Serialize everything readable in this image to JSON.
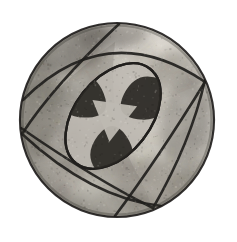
{
  "image": {
    "kind": "photograph",
    "subject": "carved stone sphere with inscribed geometric star pattern",
    "medium": "monochrome halftone photograph",
    "background_color": "#ffffff",
    "width": 237,
    "height": 242,
    "caption": "Spherical artifact incised with a three-fold curved-arc star motif",
    "alt_text": "Black and white photograph of a weathered round ball-shaped object. Three broad arcs sweep across its face dividing it into curved triangular panels, and a lens-shaped medallion at the centre holds a three-pointed dark star surrounding a pale triangle."
  },
  "sphere": {
    "label": "sphere-body",
    "center_x": 117,
    "center_y": 120,
    "radius": 97,
    "rim_color": "#1d1b19",
    "rim_width": 2.2,
    "base_light": "#cfcbc4",
    "base_mid": "#a8a49c",
    "base_dark": "#6e6a64",
    "highlight_x": 150,
    "highlight_y": 78
  },
  "palette": {
    "paper_white": "#ffffff",
    "rim_black": "#1d1b19",
    "ink_black": "#211f1d",
    "petal_dark": "#2b2925",
    "petal_shadow": "#3a3732",
    "panel_light": "#c6c2ba",
    "panel_mid": "#aba79f",
    "panel_shade": "#8d8981",
    "patina_dark": "#5d5952",
    "patina_darker": "#484440",
    "highlight": "#e3dfd7",
    "inner_triangle": "#bdb9b1"
  },
  "geometry": {
    "arcs": [
      {
        "name": "arc-upper-right",
        "note": "sweeps from upper-left of disc to lower-right rim"
      },
      {
        "name": "arc-lower-left",
        "note": "sweeps from left rim down across to bottom rim"
      },
      {
        "name": "arc-right",
        "note": "sweeps from top rim down the right side to the lower centre"
      }
    ],
    "panels": [
      {
        "name": "panel-top",
        "tone": "panel-mid"
      },
      {
        "name": "panel-left",
        "tone": "panel-shade"
      },
      {
        "name": "panel-bottom-right",
        "tone": "panel-light"
      }
    ],
    "medallion": {
      "name": "central-lens-medallion",
      "center_x": 113,
      "center_y": 116,
      "semi_major": 60,
      "semi_minor": 38,
      "rotation_deg": -52,
      "outline_color": "#211f1d"
    },
    "star": {
      "name": "three-point-star",
      "points": 3,
      "petal_count": 3,
      "petal_color": "#2b2925",
      "core_triangle_color": "#bdb9b1",
      "core_triangle_radius": 26
    }
  },
  "texture": {
    "grain_opacity": 0.3,
    "mottle_count": 210,
    "speckle_count": 900,
    "patina_patches": [
      {
        "name": "patina-upper-left",
        "cx": 70,
        "cy": 48,
        "rx": 42,
        "ry": 22,
        "rot": -18,
        "tone": "#5d5952",
        "alpha": 0.55
      },
      {
        "name": "patina-top",
        "cx": 112,
        "cy": 36,
        "rx": 34,
        "ry": 14,
        "rot": -6,
        "tone": "#4f4b45",
        "alpha": 0.45
      },
      {
        "name": "patina-left-rim",
        "cx": 40,
        "cy": 110,
        "rx": 20,
        "ry": 46,
        "rot": 4,
        "tone": "#6b6760",
        "alpha": 0.5
      },
      {
        "name": "patina-right",
        "cx": 186,
        "cy": 122,
        "rx": 24,
        "ry": 44,
        "rot": 10,
        "tone": "#6f6b64",
        "alpha": 0.45
      },
      {
        "name": "patina-lower-right",
        "cx": 158,
        "cy": 186,
        "rx": 44,
        "ry": 26,
        "rot": 16,
        "tone": "#7b776f",
        "alpha": 0.42
      },
      {
        "name": "patina-bottom",
        "cx": 104,
        "cy": 204,
        "rx": 46,
        "ry": 18,
        "rot": -4,
        "tone": "#8a867e",
        "alpha": 0.38
      },
      {
        "name": "patina-upper-right",
        "cx": 170,
        "cy": 70,
        "rx": 26,
        "ry": 18,
        "rot": -30,
        "tone": "#6a665f",
        "alpha": 0.35
      }
    ],
    "highlight_patches": [
      {
        "name": "gloss-upper-right",
        "cx": 152,
        "cy": 70,
        "rx": 36,
        "ry": 26,
        "rot": -24,
        "tone": "#e8e4dc",
        "alpha": 0.45
      },
      {
        "name": "gloss-top-edge",
        "cx": 96,
        "cy": 28,
        "rx": 40,
        "ry": 12,
        "rot": -8,
        "tone": "#efebe3",
        "alpha": 0.4
      },
      {
        "name": "gloss-bottom",
        "cx": 120,
        "cy": 196,
        "rx": 50,
        "ry": 20,
        "rot": 6,
        "tone": "#e6e2da",
        "alpha": 0.35
      }
    ]
  }
}
